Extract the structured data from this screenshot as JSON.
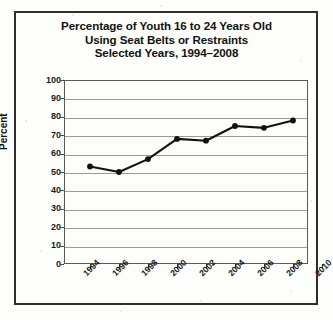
{
  "chart_data": {
    "type": "line",
    "title": "Percentage of Youth 16 to 24 Years Old Using Seat Belts or Restraints Selected Years, 1994–2008",
    "title_lines": [
      "Percentage of Youth 16 to 24 Years Old",
      "Using Seat Belts or Restraints",
      "Selected Years, 1994–2008"
    ],
    "xlabel": "",
    "ylabel": "Percent",
    "x": [
      1994,
      1996,
      1998,
      2000,
      2002,
      2004,
      2006,
      2008
    ],
    "values": [
      53,
      50,
      57,
      68,
      67,
      75,
      74,
      78
    ],
    "series": [
      {
        "name": "Percentage using seat belts or restraints",
        "values": [
          53,
          50,
          57,
          68,
          67,
          75,
          74,
          78
        ]
      }
    ],
    "xlim": [
      1993,
      2011
    ],
    "ylim": [
      0,
      100
    ],
    "xticks": [
      "1994",
      "1996",
      "1998",
      "2000",
      "2002",
      "2004",
      "2006",
      "2008",
      "2010"
    ],
    "yticks": [
      "0",
      "10",
      "20",
      "30",
      "40",
      "50",
      "60",
      "70",
      "80",
      "90",
      "100"
    ],
    "grid": "horizontal",
    "legend": "none",
    "marker": "filled-circle",
    "line_color": "#111111",
    "grid_color": "#9a9a9a",
    "background_color": "#fdfdfb"
  }
}
